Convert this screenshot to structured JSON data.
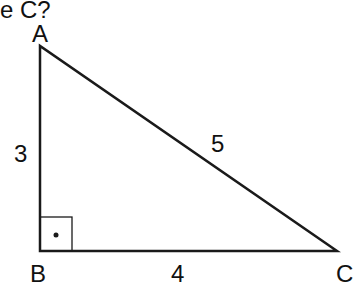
{
  "question_fragment": "e C?",
  "vertices": {
    "A": "A",
    "B": "B",
    "C": "C"
  },
  "sides": {
    "AB": "3",
    "AC": "5",
    "BC": "4"
  },
  "right_angle_at": "B",
  "colors": {
    "stroke": "#1a1a1a",
    "background": "#ffffff"
  }
}
